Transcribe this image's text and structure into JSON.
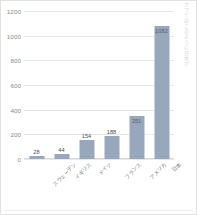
{
  "chart_data": {
    "type": "bar",
    "title": "",
    "subtitle": "",
    "xlabel": "",
    "ylabel": "",
    "ylim": [
      0,
      1200
    ],
    "ytick_step": 200,
    "yticks": [
      "1200",
      "1000",
      "800",
      "600",
      "400",
      "200",
      "0"
    ],
    "grid": "horizontal",
    "legend": "none",
    "categories": [
      "スウェーデン",
      "イギリス",
      "ドイツ",
      "フランス",
      "アメリカ",
      "日本"
    ],
    "values": [
      28,
      44,
      154,
      188,
      351,
      1082
    ],
    "value_labels": [
      "28",
      "44",
      "154",
      "188",
      "351",
      "1082"
    ],
    "bar_color": "#97a8bd",
    "gridline_color": "#e8e8e8",
    "tick_text_color": "#8a8a8a",
    "category_text_color": "#808080",
    "background_color": "#ffffff",
    "category_label_rotation_deg": -45
  },
  "edge_text": {
    "fragment": "かつてはこのように日本が"
  }
}
